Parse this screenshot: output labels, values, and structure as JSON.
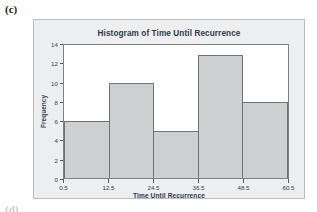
{
  "figure": {
    "part_label": "(c)",
    "next_part_label": "(d)"
  },
  "chart_data": {
    "type": "bar",
    "title": "Histogram of Time Until Recurrence",
    "xlabel": "Time Until Recurrence",
    "ylabel": "Frequency",
    "categories": [
      "0.5-12.5",
      "12.5-24.5",
      "24.5-36.5",
      "36.5-48.5",
      "48.5-60.5"
    ],
    "bin_edges": [
      0.5,
      12.5,
      24.5,
      36.5,
      48.5,
      60.5
    ],
    "x_tick_labels": [
      "0.5",
      "12.5",
      "24.5",
      "36.5",
      "48.5",
      "60.5"
    ],
    "y_tick_labels": [
      "0",
      "2",
      "4",
      "6",
      "8",
      "10",
      "12",
      "14"
    ],
    "y_ticks": [
      0,
      2,
      4,
      6,
      8,
      10,
      12,
      14
    ],
    "values": [
      6,
      10,
      5,
      13,
      8
    ],
    "bars": [
      {
        "label": "0.5-12.5",
        "value": 6
      },
      {
        "label": "12.5-24.5",
        "value": 10
      },
      {
        "label": "24.5-36.5",
        "value": 5
      },
      {
        "label": "36.5-48.5",
        "value": 13
      },
      {
        "label": "48.5-60.5",
        "value": 8
      }
    ],
    "xlim": [
      0.5,
      60.5
    ],
    "ylim": [
      0,
      14
    ],
    "grid": false,
    "legend": null,
    "colors": {
      "bar_fill": "#cdcfd1",
      "bar_border": "#6f7276",
      "panel_background": "#eceef0",
      "plot_background": "#ffffff",
      "text": "#2e3b4e"
    }
  }
}
